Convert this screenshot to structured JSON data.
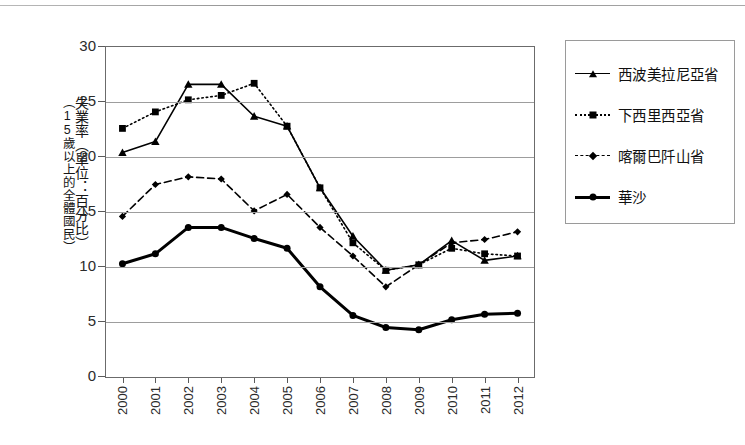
{
  "chart_data": {
    "type": "line",
    "title": "",
    "xlabel": "",
    "ylabel": "失業率（單位：百分比）（15歲以上的全體國民）",
    "ylabel_line1": "失業率（單位：百分比）",
    "ylabel_line2": "（15歲以上的全體國民）",
    "categories": [
      "2000",
      "2001",
      "2002",
      "2003",
      "2004",
      "2005",
      "2006",
      "2007",
      "2008",
      "2009",
      "2010",
      "2011",
      "2012"
    ],
    "x": [
      2000,
      2001,
      2002,
      2003,
      2004,
      2005,
      2006,
      2007,
      2008,
      2009,
      2010,
      2011,
      2012
    ],
    "ylim": [
      0,
      30
    ],
    "yticks": [
      0,
      5,
      10,
      15,
      20,
      25,
      30
    ],
    "grid": true,
    "legend_position": "right",
    "series": [
      {
        "name": "西波美拉尼亞省",
        "marker": "triangle",
        "line_style": "solid",
        "line_width": 1.6,
        "color": "#000000",
        "values": [
          20.4,
          21.4,
          26.6,
          26.6,
          23.7,
          22.8,
          17.2,
          12.8,
          9.7,
          10.2,
          12.4,
          10.6,
          11.0
        ]
      },
      {
        "name": "下西里西亞省",
        "marker": "square",
        "line_style": "dotted",
        "line_width": 1.6,
        "color": "#000000",
        "values": [
          22.6,
          24.1,
          25.2,
          25.6,
          26.7,
          22.8,
          17.2,
          12.2,
          9.7,
          10.2,
          11.7,
          11.2,
          11.0
        ]
      },
      {
        "name": "喀爾巴阡山省",
        "marker": "diamond",
        "line_style": "dashed",
        "line_width": 1.6,
        "color": "#000000",
        "values": [
          14.6,
          17.5,
          18.2,
          18.0,
          15.1,
          16.6,
          13.6,
          11.0,
          8.2,
          10.2,
          12.2,
          12.5,
          13.2
        ]
      },
      {
        "name": "華沙",
        "marker": "circle",
        "line_style": "solid",
        "line_width": 3.0,
        "color": "#000000",
        "values": [
          10.3,
          11.2,
          13.6,
          13.6,
          12.6,
          11.7,
          8.2,
          5.6,
          4.5,
          4.3,
          5.2,
          5.7,
          5.8
        ]
      }
    ]
  },
  "legend": {
    "items": [
      {
        "label": "西波美拉尼亞省"
      },
      {
        "label": "下西里西亞省"
      },
      {
        "label": "喀爾巴阡山省"
      },
      {
        "label": "華沙"
      }
    ]
  }
}
